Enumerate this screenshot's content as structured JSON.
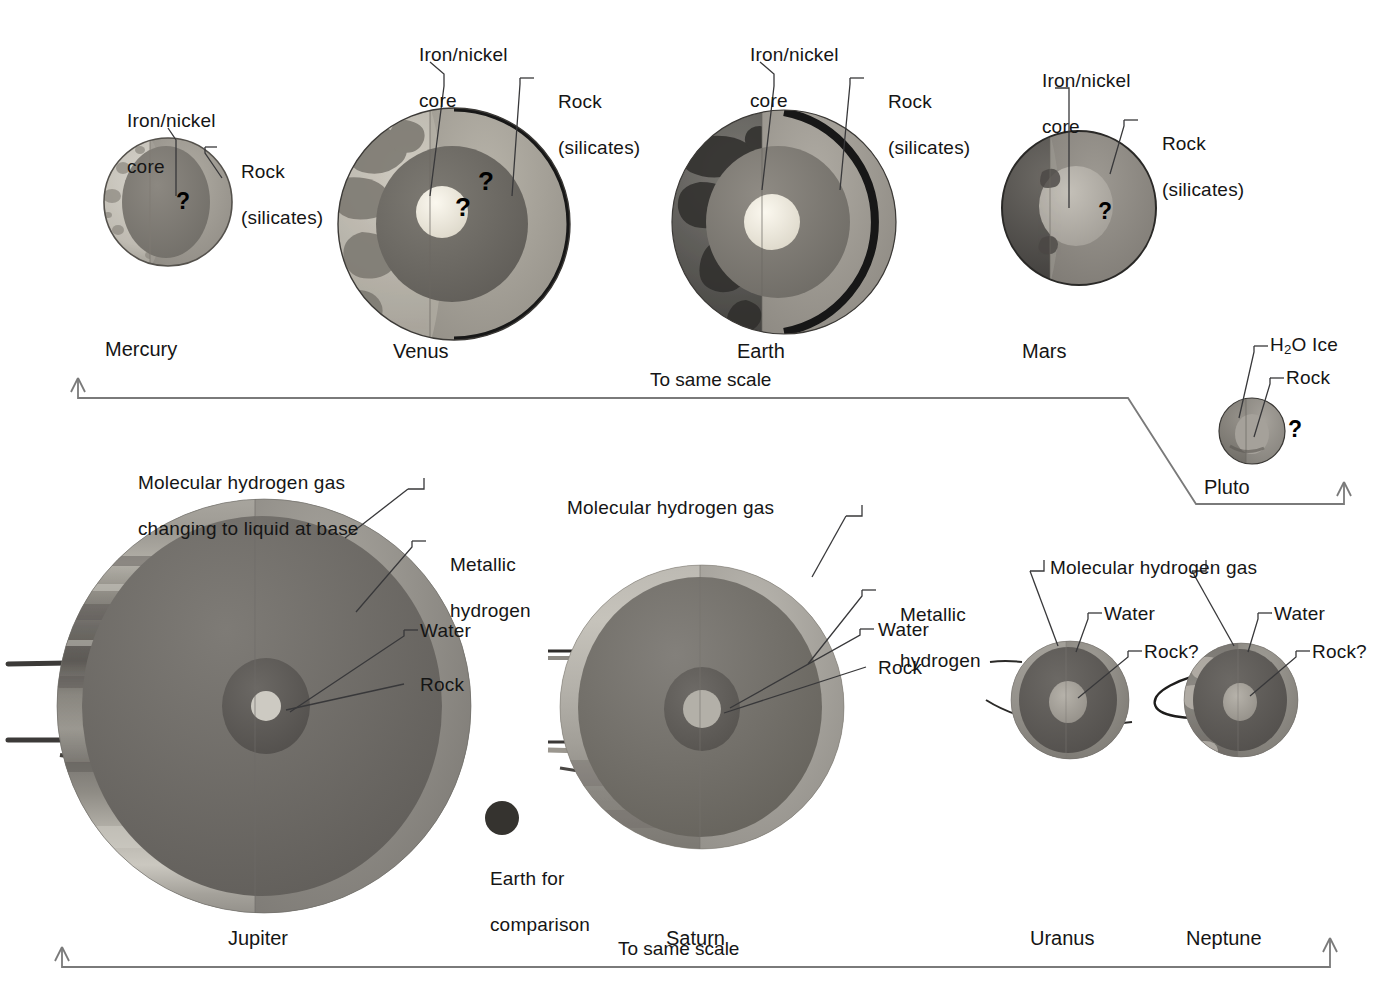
{
  "figure": {
    "scale_note_top": "To same scale",
    "scale_note_bottom": "To same scale",
    "comparison_label_line1": "Earth for",
    "comparison_label_line2": "comparison"
  },
  "terrestrial": {
    "planets": [
      {
        "name": "Mercury",
        "labels": [
          {
            "text": "Iron/nickel\ncore",
            "lines": [
              "Iron/nickel",
              "core"
            ]
          },
          {
            "text": "Rock\n(silicates)",
            "lines": [
              "Rock",
              "(silicates)"
            ]
          }
        ],
        "question_marks": 1
      },
      {
        "name": "Venus",
        "labels": [
          {
            "text": "Iron/nickel\ncore",
            "lines": [
              "Iron/nickel",
              "core"
            ]
          },
          {
            "text": "Rock\n(silicates)",
            "lines": [
              "Rock",
              "(silicates)"
            ]
          }
        ],
        "question_marks": 2
      },
      {
        "name": "Earth",
        "labels": [
          {
            "text": "Iron/nickel\ncore",
            "lines": [
              "Iron/nickel",
              "core"
            ]
          },
          {
            "text": "Rock\n(silicates)",
            "lines": [
              "Rock",
              "(silicates)"
            ]
          }
        ],
        "question_marks": 0
      },
      {
        "name": "Mars",
        "labels": [
          {
            "text": "Iron/nickel\ncore",
            "lines": [
              "Iron/nickel",
              "core"
            ]
          },
          {
            "text": "Rock\n(silicates)",
            "lines": [
              "Rock",
              "(silicates)"
            ]
          }
        ],
        "question_marks": 1
      },
      {
        "name": "Pluto",
        "labels": [
          {
            "text": "H2O Ice",
            "lines": [
              "H₂O Ice"
            ]
          },
          {
            "text": "Rock",
            "lines": [
              "Rock"
            ]
          }
        ],
        "question_marks": 1
      }
    ],
    "label_strings": {
      "iron_nickel_l1": "Iron/nickel",
      "iron_nickel_l2": "core",
      "rock_l1": "Rock",
      "rock_l2": "(silicates)",
      "h2o_ice_pre": "H",
      "h2o_ice_sub": "2",
      "h2o_ice_post": "O Ice",
      "rock_plain": "Rock"
    }
  },
  "giants": {
    "planets": [
      {
        "name": "Jupiter",
        "labels": [
          {
            "lines": [
              "Molecular hydrogen gas",
              "changing to liquid at base"
            ]
          },
          {
            "lines": [
              "Metallic",
              "hydrogen"
            ]
          },
          {
            "lines": [
              "Water"
            ]
          },
          {
            "lines": [
              "Rock"
            ]
          }
        ]
      },
      {
        "name": "Saturn",
        "labels": [
          {
            "lines": [
              "Molecular hydrogen gas"
            ]
          },
          {
            "lines": [
              "Metallic",
              "hydrogen"
            ]
          },
          {
            "lines": [
              "Water"
            ]
          },
          {
            "lines": [
              "Rock"
            ]
          }
        ]
      },
      {
        "name": "Uranus",
        "labels": [
          {
            "lines": [
              "Molecular hydrogen gas"
            ]
          },
          {
            "lines": [
              "Water"
            ]
          },
          {
            "lines": [
              "Rock?"
            ]
          }
        ]
      },
      {
        "name": "Neptune",
        "labels": [
          {
            "lines": [
              "Water"
            ]
          },
          {
            "lines": [
              "Rock?"
            ]
          }
        ]
      }
    ],
    "label_strings": {
      "mol_h2_gas": "Molecular hydrogen gas",
      "jupiter_mol_l1": "Molecular hydrogen gas",
      "jupiter_mol_l2": "changing to liquid at base",
      "metallic_l1": "Metallic",
      "metallic_l2": "hydrogen",
      "water": "Water",
      "rock": "Rock",
      "rock_q": "Rock?"
    }
  },
  "colors": {
    "mercury_crust": "#bfbcb4",
    "mercury_mantle": "#9b978e",
    "mercury_core": "#7e7a73",
    "venus_surface": "#b9b5ab",
    "venus_mantle": "#a5a199",
    "venus_outer_core": "#6f6c66",
    "venus_core": "#ece8dd",
    "earth_surface": "#5c5a56",
    "earth_mantle": "#9e9a92",
    "earth_outer_core": "#85817a",
    "earth_core": "#efece2",
    "mars_surface": "#56534f",
    "mars_mantle": "#8e8a84",
    "mars_core": "#b4b0a8",
    "pluto_body": "#7c7973",
    "pluto_inner": "#94918a",
    "jupiter_gas": "#8d8a84",
    "jupiter_metallic": "#6e6b66",
    "jupiter_water": "#5f5c58",
    "jupiter_rock": "#c9c6bd",
    "saturn_gas": "#a09d96",
    "saturn_metallic": "#726f6a",
    "saturn_water": "#63605c",
    "uranus_gas": "#8b8882",
    "uranus_water": "#5e5b57",
    "uranus_rock": "#a6a29a",
    "leader_line": "#3a3a3a",
    "scale_bar": "#6a6a6a",
    "text": "#151515"
  }
}
